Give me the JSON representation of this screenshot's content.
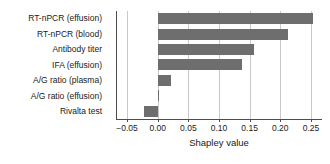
{
  "chart_data": {
    "type": "bar",
    "orientation": "horizontal",
    "title": "",
    "xlabel": "Shapley value",
    "ylabel": "",
    "categories": [
      "RT-nPCR (effusion)",
      "RT-nPCR (blood)",
      "Antibody titer",
      "IFA (effusion)",
      "A/G ratio (plasma)",
      "A/G ratio (effusion)",
      "Rivalta test"
    ],
    "values": [
      0.253,
      0.212,
      0.157,
      0.137,
      0.022,
      0.002,
      -0.023
    ],
    "xlim": [
      -0.068,
      0.268
    ],
    "xticks": [
      -0.05,
      0.0,
      0.05,
      0.1,
      0.15,
      0.2,
      0.25
    ],
    "xticklabels": [
      "−0.05",
      "0.00",
      "0.05",
      "0.10",
      "0.15",
      "0.20",
      "0.25"
    ],
    "grid": "vertical",
    "legend": null,
    "bar_color": "#6e6e6e",
    "grid_color": "#c9c9c9",
    "axis_color": "#4d4d4d",
    "background": "#ffffff"
  }
}
